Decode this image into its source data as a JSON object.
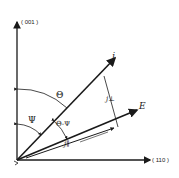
{
  "diagram": {
    "axes": {
      "vertical_label": "( 001 )",
      "horizontal_label": "( 110 )"
    },
    "vectors": {
      "current_density": "j",
      "electric_field": "E",
      "parallel_component": "j∥",
      "perpendicular_component": "j⊥"
    },
    "angles": {
      "theta": "Θ",
      "psi": "Ψ",
      "theta_minus_psi": "Θ-Ψ"
    },
    "colors": {
      "line": "#1a1a1a",
      "background": "#ffffff"
    }
  }
}
